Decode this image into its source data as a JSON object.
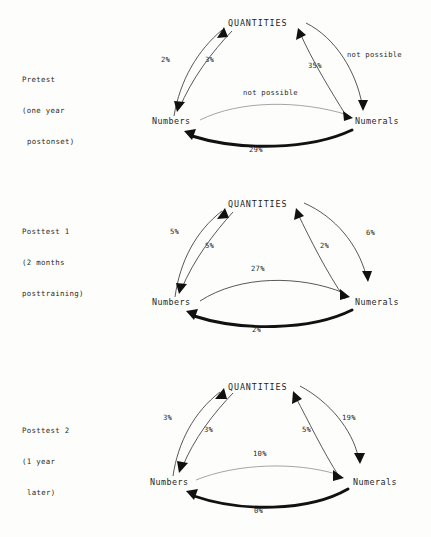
{
  "figure": {
    "node_top": "QUANTITIES",
    "node_left": "Numbers",
    "node_right": "Numerals"
  },
  "panels": [
    {
      "id": "pretest",
      "caption_line_1": "Pretest",
      "caption_line_2": "(one year",
      "caption_line_3": "postonset)",
      "edges": [
        {
          "name": "quantities-to-numbers",
          "label": "2%"
        },
        {
          "name": "numbers-to-quantities",
          "label": "3%"
        },
        {
          "name": "numerals-to-quantities",
          "label": "35%"
        },
        {
          "name": "quantities-to-numerals",
          "label": "not possible"
        },
        {
          "name": "numbers-to-numerals",
          "label": "not possible"
        },
        {
          "name": "numerals-to-numbers",
          "label": "29%"
        }
      ]
    },
    {
      "id": "posttest-1",
      "caption_line_1": "Posttest 1",
      "caption_line_2": "(2 months",
      "caption_line_3": "posttraining)",
      "edges": [
        {
          "name": "quantities-to-numbers",
          "label": "5%"
        },
        {
          "name": "numbers-to-quantities",
          "label": "5%"
        },
        {
          "name": "numerals-to-quantities",
          "label": "2%"
        },
        {
          "name": "quantities-to-numerals",
          "label": "6%"
        },
        {
          "name": "numbers-to-numerals",
          "label": "27%"
        },
        {
          "name": "numerals-to-numbers",
          "label": "2%"
        }
      ]
    },
    {
      "id": "posttest-2",
      "caption_line_1": "Posttest 2",
      "caption_line_2": "(1 year",
      "caption_line_3": "later)",
      "edges": [
        {
          "name": "quantities-to-numbers",
          "label": "3%"
        },
        {
          "name": "numbers-to-quantities",
          "label": "3%"
        },
        {
          "name": "numerals-to-quantities",
          "label": "5%"
        },
        {
          "name": "quantities-to-numerals",
          "label": "19%"
        },
        {
          "name": "numbers-to-numerals",
          "label": "10%"
        },
        {
          "name": "numerals-to-numbers",
          "label": "0%"
        }
      ]
    }
  ],
  "colors": {
    "ink": "#1a1a1a",
    "bold_edge": "#111111",
    "thin_edge": "#3a3a3a",
    "background": "#fdfdfc"
  }
}
